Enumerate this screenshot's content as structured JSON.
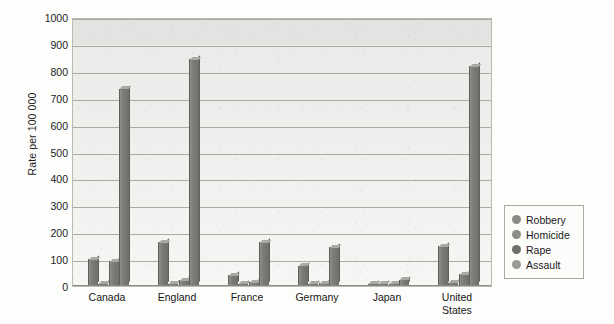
{
  "chart_data": {
    "type": "bar",
    "title": "",
    "subtitle": "",
    "xlabel": "",
    "ylabel": "Rate per 100 000",
    "ylim": [
      0,
      1000
    ],
    "ytick_step": 100,
    "yticks": [
      1000,
      900,
      800,
      700,
      600,
      500,
      400,
      300,
      200,
      100,
      0
    ],
    "ytick_labels": [
      "1000",
      "900",
      "800",
      "700",
      "600",
      "500",
      "400",
      "300",
      "200",
      "100",
      "0"
    ],
    "grid": true,
    "grid_axis": "y",
    "legend_position": "right",
    "categories": [
      "Canada",
      "England",
      "France",
      "Germany",
      "Japan",
      "United\nStates"
    ],
    "category_labels": [
      "Canada",
      "England",
      "France",
      "Germany",
      "Japan",
      "United States"
    ],
    "series": [
      {
        "name": "Robbery",
        "color": "#7d7d79",
        "values": [
          95,
          160,
          38,
          72,
          3,
          145
        ]
      },
      {
        "name": "Homicide",
        "color": "#8a8a86",
        "values": [
          2,
          2,
          2,
          2,
          1,
          9
        ]
      },
      {
        "name": "Rape",
        "color": "#6f6f6b",
        "values": [
          88,
          18,
          10,
          8,
          2,
          40
        ]
      },
      {
        "name": "Assault",
        "color": "#7b7b77",
        "values": [
          730,
          840,
          160,
          140,
          20,
          815
        ]
      }
    ],
    "annotations": []
  },
  "legend": {
    "items": [
      {
        "label": "Robbery",
        "color": "#8b8b87"
      },
      {
        "label": "Homicide",
        "color": "#8b8b87"
      },
      {
        "label": "Rape",
        "color": "#6e6e6a"
      },
      {
        "label": "Assault",
        "color": "#9a9a96"
      }
    ]
  }
}
